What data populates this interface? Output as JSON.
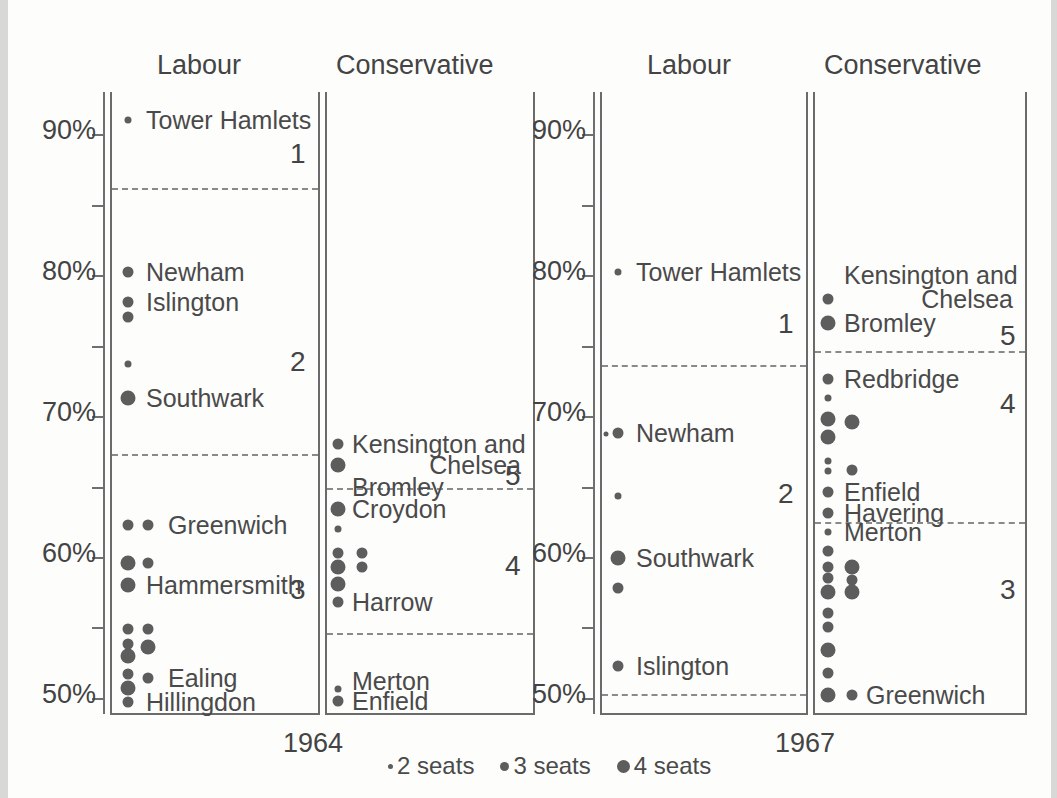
{
  "figure": {
    "width": 1057,
    "height": 798,
    "dot_color": "#5d5d5d",
    "text_color": "#444444",
    "axis_color": "#6f6f6f"
  },
  "legend": {
    "items": [
      {
        "label": "2 seats",
        "size": 5
      },
      {
        "label": "3 seats",
        "size": 9
      },
      {
        "label": "4 seats",
        "size": 13
      }
    ]
  },
  "chart_data": {
    "type": "scatter",
    "title": "",
    "ylabel": "",
    "xlabel": "",
    "ylim": [
      49,
      93
    ],
    "ytick_values": [
      90,
      85,
      80,
      75,
      70,
      65,
      60,
      55,
      50
    ],
    "ytick_labels": [
      "90%",
      "",
      "80%",
      "",
      "70%",
      "",
      "60%",
      "",
      "50%"
    ],
    "grid": false,
    "legend_position": "bottom-center",
    "size_encoding": {
      "2": "2 seats",
      "3": "3 seats",
      "4": "4 seats"
    },
    "panels": [
      {
        "id": "labour-1964",
        "column_title": "Labour",
        "year": "1964",
        "cluster_boundaries": [
          86.2,
          67.3
        ],
        "cluster_numbers": [
          {
            "label": "1",
            "y": 88.5
          },
          {
            "label": "2",
            "y": 73.8
          },
          {
            "label": "3",
            "y": 57.6
          }
        ],
        "points": [
          {
            "y": 91.0,
            "seats": 2,
            "col": 0,
            "label": "Tower Hamlets"
          },
          {
            "y": 80.2,
            "seats": 3,
            "col": 0,
            "label": "Newham"
          },
          {
            "y": 78.1,
            "seats": 3,
            "col": 0,
            "label": "Islington"
          },
          {
            "y": 77.0,
            "seats": 3,
            "col": 0,
            "label": ""
          },
          {
            "y": 73.7,
            "seats": 2,
            "col": 0,
            "label": ""
          },
          {
            "y": 71.3,
            "seats": 4,
            "col": 0,
            "label": "Southwark"
          },
          {
            "y": 62.3,
            "seats": 3,
            "col": 0,
            "label": ""
          },
          {
            "y": 62.3,
            "seats": 3,
            "col": 1,
            "label": "Greenwich"
          },
          {
            "y": 59.6,
            "seats": 4,
            "col": 0,
            "label": ""
          },
          {
            "y": 59.6,
            "seats": 3,
            "col": 1,
            "label": ""
          },
          {
            "y": 58.0,
            "seats": 4,
            "col": 0,
            "label": "Hammersmith"
          },
          {
            "y": 54.9,
            "seats": 3,
            "col": 0,
            "label": ""
          },
          {
            "y": 54.9,
            "seats": 3,
            "col": 1,
            "label": ""
          },
          {
            "y": 53.8,
            "seats": 3,
            "col": 0,
            "label": ""
          },
          {
            "y": 53.6,
            "seats": 4,
            "col": 1,
            "label": ""
          },
          {
            "y": 53.0,
            "seats": 4,
            "col": 0,
            "label": ""
          },
          {
            "y": 51.7,
            "seats": 3,
            "col": 0,
            "label": ""
          },
          {
            "y": 51.4,
            "seats": 3,
            "col": 1,
            "label": "Ealing"
          },
          {
            "y": 50.7,
            "seats": 4,
            "col": 0,
            "label": ""
          },
          {
            "y": 49.7,
            "seats": 3,
            "col": 0,
            "label": "Hillingdon"
          }
        ]
      },
      {
        "id": "conservative-1964",
        "column_title": "Conservative",
        "year": "1964",
        "cluster_boundaries": [
          64.9,
          54.6
        ],
        "cluster_numbers": [
          {
            "label": "5",
            "y": 65.7
          },
          {
            "label": "4",
            "y": 59.3
          }
        ],
        "points": [
          {
            "y": 68.0,
            "seats": 3,
            "col": 0,
            "label": "Kensington and"
          },
          {
            "y": 66.5,
            "seats": 4,
            "col": 0,
            "label": "Chelsea"
          },
          {
            "y": 65.0,
            "seats": 0,
            "col": 0,
            "label": "Bromley"
          },
          {
            "y": 63.4,
            "seats": 4,
            "col": 0,
            "label": "Croydon"
          },
          {
            "y": 62.0,
            "seats": 2,
            "col": 0,
            "label": ""
          },
          {
            "y": 60.3,
            "seats": 3,
            "col": 0,
            "label": ""
          },
          {
            "y": 60.3,
            "seats": 3,
            "col": 1,
            "label": ""
          },
          {
            "y": 59.3,
            "seats": 4,
            "col": 0,
            "label": ""
          },
          {
            "y": 59.3,
            "seats": 3,
            "col": 1,
            "label": ""
          },
          {
            "y": 58.1,
            "seats": 4,
            "col": 0,
            "label": ""
          },
          {
            "y": 56.8,
            "seats": 3,
            "col": 0,
            "label": "Harrow"
          },
          {
            "y": 51.2,
            "seats": 0,
            "col": 0,
            "label": "Merton"
          },
          {
            "y": 50.6,
            "seats": 2,
            "col": 0,
            "label": ""
          },
          {
            "y": 49.8,
            "seats": 3,
            "col": 0,
            "label": "Enfield"
          }
        ]
      },
      {
        "id": "labour-1967",
        "column_title": "Labour",
        "year": "1967",
        "cluster_boundaries": [
          73.6,
          50.3
        ],
        "cluster_numbers": [
          {
            "label": "1",
            "y": 76.5
          },
          {
            "label": "2",
            "y": 64.4
          }
        ],
        "points": [
          {
            "y": 80.2,
            "seats": 2,
            "col": 0,
            "label": "Tower Hamlets"
          },
          {
            "y": 68.8,
            "seats": 3,
            "col": 0,
            "label": "Newham"
          },
          {
            "y": 68.7,
            "seats": 1,
            "col": -1,
            "label": ""
          },
          {
            "y": 64.3,
            "seats": 2,
            "col": 0,
            "label": ""
          },
          {
            "y": 59.9,
            "seats": 4,
            "col": 0,
            "label": "Southwark"
          },
          {
            "y": 57.8,
            "seats": 3,
            "col": 0,
            "label": ""
          },
          {
            "y": 52.3,
            "seats": 3,
            "col": 0,
            "label": "Islington"
          }
        ]
      },
      {
        "id": "conservative-1967",
        "column_title": "Conservative",
        "year": "1967",
        "cluster_boundaries": [
          74.6,
          62.5
        ],
        "cluster_numbers": [
          {
            "label": "5",
            "y": 75.6
          },
          {
            "label": "4",
            "y": 70.8
          },
          {
            "label": "3",
            "y": 57.6
          }
        ],
        "points": [
          {
            "y": 80.0,
            "seats": 0,
            "col": 0,
            "label": "Kensington and"
          },
          {
            "y": 78.3,
            "seats": 3,
            "col": 0,
            "label": "Chelsea"
          },
          {
            "y": 76.6,
            "seats": 4,
            "col": 0,
            "label": "Bromley"
          },
          {
            "y": 72.6,
            "seats": 3,
            "col": 0,
            "label": "Redbridge"
          },
          {
            "y": 71.3,
            "seats": 2,
            "col": 0,
            "label": ""
          },
          {
            "y": 69.8,
            "seats": 4,
            "col": 0,
            "label": ""
          },
          {
            "y": 69.6,
            "seats": 4,
            "col": 1,
            "label": ""
          },
          {
            "y": 68.5,
            "seats": 4,
            "col": 0,
            "label": ""
          },
          {
            "y": 66.8,
            "seats": 2,
            "col": 0,
            "label": ""
          },
          {
            "y": 66.1,
            "seats": 2,
            "col": 0,
            "label": ""
          },
          {
            "y": 66.2,
            "seats": 3,
            "col": 1,
            "label": ""
          },
          {
            "y": 64.6,
            "seats": 3,
            "col": 0,
            "label": "Enfield"
          },
          {
            "y": 63.1,
            "seats": 3,
            "col": 0,
            "label": "Havering"
          },
          {
            "y": 61.8,
            "seats": 2,
            "col": 0,
            "label": "Merton"
          },
          {
            "y": 60.4,
            "seats": 3,
            "col": 0,
            "label": ""
          },
          {
            "y": 59.3,
            "seats": 3,
            "col": 0,
            "label": ""
          },
          {
            "y": 59.3,
            "seats": 4,
            "col": 1,
            "label": ""
          },
          {
            "y": 58.5,
            "seats": 3,
            "col": 0,
            "label": ""
          },
          {
            "y": 58.4,
            "seats": 3,
            "col": 1,
            "label": ""
          },
          {
            "y": 57.5,
            "seats": 4,
            "col": 0,
            "label": ""
          },
          {
            "y": 57.5,
            "seats": 4,
            "col": 1,
            "label": ""
          },
          {
            "y": 56.0,
            "seats": 3,
            "col": 0,
            "label": ""
          },
          {
            "y": 55.0,
            "seats": 3,
            "col": 0,
            "label": ""
          },
          {
            "y": 53.4,
            "seats": 4,
            "col": 0,
            "label": ""
          },
          {
            "y": 51.8,
            "seats": 3,
            "col": 0,
            "label": ""
          },
          {
            "y": 50.2,
            "seats": 4,
            "col": 0,
            "label": ""
          },
          {
            "y": 50.2,
            "seats": 3,
            "col": 1,
            "label": "Greenwich"
          }
        ]
      }
    ]
  },
  "layout": {
    "axes": [
      {
        "id": "axis-1964",
        "x": 103,
        "top": 92,
        "bottom": 712,
        "label_x": 96,
        "panels": [
          {
            "ref": "labour-1964",
            "left": 110,
            "right": 318,
            "dot_x": 128,
            "dot_x2": 148,
            "title_x": 157,
            "num_x": 290,
            "label_x": 146
          },
          {
            "ref": "conservative-1964",
            "left": 325,
            "right": 533,
            "dot_x": 338,
            "dot_x2": 362,
            "title_x": 336,
            "num_x": 505,
            "label_x": 352
          }
        ],
        "year_x": 283,
        "year_y": 728
      },
      {
        "id": "axis-1967",
        "x": 593,
        "top": 92,
        "bottom": 712,
        "label_x": 586,
        "panels": [
          {
            "ref": "labour-1967",
            "left": 600,
            "right": 806,
            "dot_x": 618,
            "dot_x2": 640,
            "title_x": 647,
            "num_x": 778,
            "label_x": 636
          },
          {
            "ref": "conservative-1967",
            "left": 813,
            "right": 1025,
            "dot_x": 828,
            "dot_x2": 852,
            "title_x": 824,
            "num_x": 1000,
            "label_x": 844
          }
        ],
        "year_x": 775,
        "year_y": 728
      }
    ],
    "column_title_y": 70,
    "legend_x": 388,
    "legend_y": 752
  }
}
